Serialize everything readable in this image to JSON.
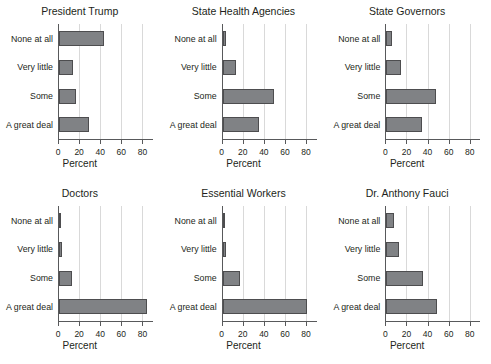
{
  "figure": {
    "categories": [
      "None at all",
      "Very little",
      "Some",
      "A great deal"
    ],
    "xlabel": "Percent",
    "xticks": [
      "0",
      "20",
      "40",
      "60",
      "80"
    ],
    "xtick_values": [
      0,
      20,
      40,
      60,
      80
    ],
    "xlim": [
      0,
      90
    ],
    "bar_color": "#808285",
    "bar_edge_color": "#4d4d4f",
    "grid_color": "#d9d9d9",
    "axis_color": "#58595b",
    "background": "#ffffff"
  },
  "chart_data": [
    {
      "type": "bar",
      "title": "President Trump",
      "orientation": "horizontal",
      "categories": [
        "None at all",
        "Very little",
        "Some",
        "A great deal"
      ],
      "values": [
        43,
        13,
        16,
        28
      ],
      "xlabel": "Percent",
      "ylabel": "",
      "xlim": [
        0,
        90
      ],
      "grid": true
    },
    {
      "type": "bar",
      "title": "State Health Agencies",
      "orientation": "horizontal",
      "categories": [
        "None at all",
        "Very little",
        "Some",
        "A great deal"
      ],
      "values": [
        3,
        13,
        49,
        34
      ],
      "xlabel": "Percent",
      "ylabel": "",
      "xlim": [
        0,
        90
      ],
      "grid": true
    },
    {
      "type": "bar",
      "title": "State Governors",
      "orientation": "horizontal",
      "categories": [
        "None at all",
        "Very little",
        "Some",
        "A great deal"
      ],
      "values": [
        5,
        14,
        47,
        34
      ],
      "xlabel": "Percent",
      "ylabel": "",
      "xlim": [
        0,
        90
      ],
      "grid": true
    },
    {
      "type": "bar",
      "title": "Doctors",
      "orientation": "horizontal",
      "categories": [
        "None at all",
        "Very little",
        "Some",
        "A great deal"
      ],
      "values": [
        2,
        3,
        12,
        83
      ],
      "xlabel": "Percent",
      "ylabel": "",
      "xlim": [
        0,
        90
      ],
      "grid": true
    },
    {
      "type": "bar",
      "title": "Essential Workers",
      "orientation": "horizontal",
      "categories": [
        "None at all",
        "Very little",
        "Some",
        "A great deal"
      ],
      "values": [
        2,
        3,
        16,
        80
      ],
      "xlabel": "Percent",
      "ylabel": "",
      "xlim": [
        0,
        90
      ],
      "grid": true
    },
    {
      "type": "bar",
      "title": "Dr. Anthony Fauci",
      "orientation": "horizontal",
      "categories": [
        "None at all",
        "Very little",
        "Some",
        "A great deal"
      ],
      "values": [
        7,
        12,
        35,
        48
      ],
      "xlabel": "Percent",
      "ylabel": "",
      "xlim": [
        0,
        90
      ],
      "grid": true
    }
  ]
}
